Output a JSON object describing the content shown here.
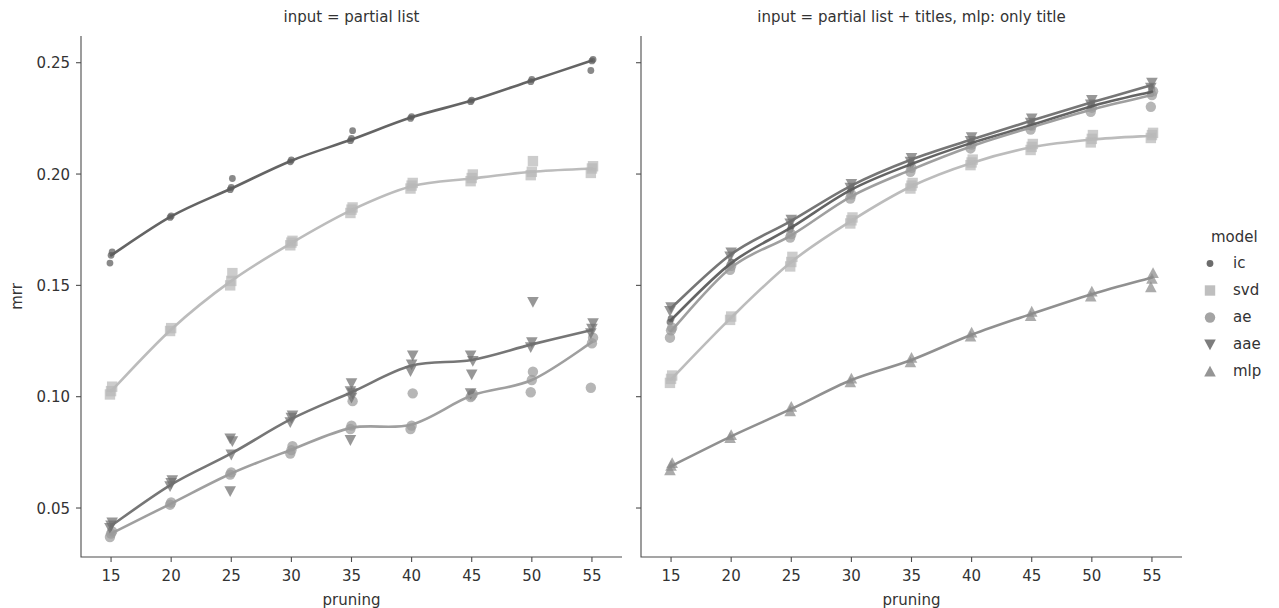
{
  "figure": {
    "width": 1279,
    "height": 608,
    "background": "#ffffff"
  },
  "axes": {
    "ylabel": "mrr",
    "xlabel": "pruning",
    "yticks": [
      "0.05",
      "0.10",
      "0.15",
      "0.20",
      "0.25"
    ],
    "ytick_values": [
      0.05,
      0.1,
      0.15,
      0.2,
      0.25
    ],
    "xticks": [
      "15",
      "20",
      "25",
      "30",
      "35",
      "40",
      "45",
      "50",
      "55"
    ],
    "xtick_values": [
      15,
      20,
      25,
      30,
      35,
      40,
      45,
      50,
      55
    ],
    "xlim": [
      12.5,
      57.5
    ],
    "ylim": [
      0.028,
      0.262
    ],
    "grid": false
  },
  "legend": {
    "title": "model",
    "position": "right",
    "entries": [
      {
        "label": "ic",
        "marker": "circle-small",
        "color": "#5c5c5c"
      },
      {
        "label": "svd",
        "marker": "square",
        "color": "#b8b8b8"
      },
      {
        "label": "ae",
        "marker": "circle",
        "color": "#9a9a9a"
      },
      {
        "label": "aae",
        "marker": "triangle-down",
        "color": "#6f6f6f"
      },
      {
        "label": "mlp",
        "marker": "triangle-up",
        "color": "#8a8a8a"
      }
    ]
  },
  "chart_data": {
    "type": "scatter",
    "title": "",
    "xlabel": "pruning",
    "ylabel": "mrr",
    "xlim": [
      12.5,
      57.5
    ],
    "ylim": [
      0.028,
      0.262
    ],
    "grid": false,
    "legend_title": "model",
    "legend_position": "right",
    "panels": [
      {
        "title": "input = partial list",
        "x": [
          15,
          20,
          25,
          30,
          35,
          40,
          45,
          50,
          55
        ],
        "series": [
          {
            "name": "ic",
            "marker": "circle-small",
            "color": "#5c5c5c",
            "values": [
              0.1635,
              0.181,
              0.1935,
              0.206,
              0.2155,
              0.2255,
              0.233,
              0.242,
              0.251
            ],
            "scatter": [
              [
                0.16,
                0.1635,
                0.165
              ],
              [
                0.1805,
                0.1812
              ],
              [
                0.193,
                0.194,
                0.198
              ],
              [
                0.2055,
                0.2063
              ],
              [
                0.215,
                0.216,
                0.2195
              ],
              [
                0.225,
                0.2258
              ],
              [
                0.2325,
                0.2332
              ],
              [
                0.2415,
                0.2425
              ],
              [
                0.2465,
                0.2508,
                0.2515
              ]
            ]
          },
          {
            "name": "svd",
            "marker": "square",
            "color": "#b8b8b8",
            "values": [
              0.1025,
              0.1302,
              0.152,
              0.169,
              0.1838,
              0.1945,
              0.198,
              0.201,
              0.2025
            ],
            "scatter": [
              [
                0.101,
                0.1025,
                0.1045
              ],
              [
                0.1295,
                0.1308
              ],
              [
                0.15,
                0.152,
                0.1555
              ],
              [
                0.168,
                0.1692,
                0.17
              ],
              [
                0.1825,
                0.184,
                0.185
              ],
              [
                0.1935,
                0.1948,
                0.196
              ],
              [
                0.1968,
                0.1982,
                0.1998
              ],
              [
                0.1995,
                0.201,
                0.2058
              ],
              [
                0.2005,
                0.2025,
                0.2035
              ]
            ]
          },
          {
            "name": "ae",
            "marker": "circle",
            "color": "#9a9a9a",
            "values": [
              0.0385,
              0.052,
              0.0655,
              0.0762,
              0.086,
              0.0875,
              0.1005,
              0.1075,
              0.1245
            ],
            "scatter": [
              [
                0.037,
                0.0385,
                0.0395
              ],
              [
                0.0515,
                0.0525
              ],
              [
                0.065,
                0.066
              ],
              [
                0.0745,
                0.076,
                0.0778
              ],
              [
                0.0855,
                0.087,
                0.098
              ],
              [
                0.0855,
                0.087,
                0.1015
              ],
              [
                0.0998,
                0.1005,
                0.1012
              ],
              [
                0.102,
                0.1075,
                0.1112
              ],
              [
                0.104,
                0.124,
                0.1265
              ]
            ]
          },
          {
            "name": "aae",
            "marker": "triangle-down",
            "color": "#6f6f6f",
            "values": [
              0.042,
              0.0605,
              0.0745,
              0.09,
              0.102,
              0.114,
              0.1165,
              0.1235,
              0.13
            ],
            "scatter": [
              [
                0.041,
                0.0422,
                0.0435
              ],
              [
                0.0598,
                0.0612,
                0.0625
              ],
              [
                0.0575,
                0.074,
                0.08,
                0.0812
              ],
              [
                0.0885,
                0.0905,
                0.0915
              ],
              [
                0.0805,
                0.0995,
                0.1015,
                0.1025,
                0.106
              ],
              [
                0.1115,
                0.1145,
                0.1185
              ],
              [
                0.1015,
                0.11,
                0.116,
                0.1185
              ],
              [
                0.1222,
                0.1245,
                0.1425
              ],
              [
                0.1285,
                0.1305,
                0.133
              ]
            ]
          }
        ]
      },
      {
        "title": "input = partial list + titles, mlp: only title",
        "x": [
          15,
          20,
          25,
          30,
          35,
          40,
          45,
          50,
          55
        ],
        "series": [
          {
            "name": "ic",
            "marker": "circle-small",
            "color": "#5c5c5c",
            "values": [
              0.1345,
              0.16,
              0.176,
              0.193,
              0.2045,
              0.214,
              0.222,
              0.2305,
              0.237
            ],
            "scatter": [
              [
                0.1335,
                0.135
              ],
              [
                0.1592,
                0.1605
              ],
              [
                0.175,
                0.1765
              ],
              [
                0.1922,
                0.1935
              ],
              [
                0.2038,
                0.205
              ],
              [
                0.2132,
                0.2145
              ],
              [
                0.2212,
                0.2228
              ],
              [
                0.2298,
                0.2312
              ],
              [
                0.2362,
                0.238
              ]
            ]
          },
          {
            "name": "svd",
            "marker": "square",
            "color": "#b8b8b8",
            "values": [
              0.1078,
              0.1355,
              0.1605,
              0.179,
              0.1945,
              0.205,
              0.212,
              0.2155,
              0.2172
            ],
            "scatter": [
              [
                0.1062,
                0.108,
                0.1095
              ],
              [
                0.1345,
                0.136
              ],
              [
                0.1585,
                0.1605,
                0.1628
              ],
              [
                0.1778,
                0.1792,
                0.1805
              ],
              [
                0.1935,
                0.1948,
                0.196
              ],
              [
                0.204,
                0.2052,
                0.2065
              ],
              [
                0.2108,
                0.2122,
                0.2135
              ],
              [
                0.2142,
                0.2158,
                0.2175
              ],
              [
                0.2162,
                0.2175,
                0.2185
              ]
            ]
          },
          {
            "name": "ae",
            "marker": "circle",
            "color": "#9a9a9a",
            "values": [
              0.1295,
              0.158,
              0.1725,
              0.19,
              0.202,
              0.2125,
              0.221,
              0.229,
              0.2355
            ],
            "scatter": [
              [
                0.1265,
                0.1298,
                0.131
              ],
              [
                0.157,
                0.1588
              ],
              [
                0.1715,
                0.173
              ],
              [
                0.189,
                0.1908
              ],
              [
                0.201,
                0.2028
              ],
              [
                0.2115,
                0.2132
              ],
              [
                0.22,
                0.2218
              ],
              [
                0.228,
                0.2298
              ],
              [
                0.2302,
                0.2355,
                0.2372
              ]
            ]
          },
          {
            "name": "aae",
            "marker": "triangle-down",
            "color": "#6f6f6f",
            "values": [
              0.1398,
              0.164,
              0.179,
              0.1948,
              0.2065,
              0.2155,
              0.224,
              0.2322,
              0.24
            ],
            "scatter": [
              [
                0.1385,
                0.1402
              ],
              [
                0.163,
                0.1648
              ],
              [
                0.1778,
                0.1795
              ],
              [
                0.1938,
                0.1955
              ],
              [
                0.2055,
                0.2072
              ],
              [
                0.2148,
                0.2165
              ],
              [
                0.223,
                0.225
              ],
              [
                0.2312,
                0.2332
              ],
              [
                0.2388,
                0.241
              ]
            ]
          },
          {
            "name": "mlp",
            "marker": "triangle-up",
            "color": "#8a8a8a",
            "values": [
              0.0688,
              0.0822,
              0.0945,
              0.1075,
              0.1165,
              0.1278,
              0.1372,
              0.146,
              0.1535
            ],
            "scatter": [
              [
                0.067,
                0.069,
                0.0702
              ],
              [
                0.0815,
                0.0828
              ],
              [
                0.0935,
                0.0955
              ],
              [
                0.1065,
                0.1082
              ],
              [
                0.1155,
                0.1175
              ],
              [
                0.127,
                0.1288
              ],
              [
                0.1362,
                0.1382
              ],
              [
                0.145,
                0.1472
              ],
              [
                0.1492,
                0.153,
                0.1555
              ]
            ]
          }
        ]
      }
    ]
  }
}
